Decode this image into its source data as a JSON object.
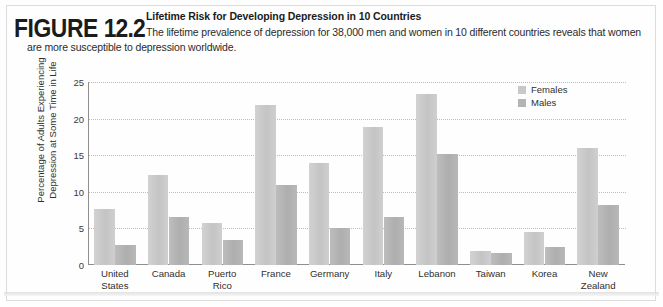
{
  "figure": {
    "label_word": "FIGURE",
    "label_number": "12.2",
    "title": "Lifetime Risk for Developing Depression in 10 Countries",
    "caption_line1": "The lifetime prevalence of depression for 38,000 men and women in 10 different countries reveals that women",
    "caption_line2": "are more susceptible to depression worldwide."
  },
  "legend": {
    "position": "top-right",
    "entries": [
      {
        "label": "Females",
        "color": "#c8c8c8"
      },
      {
        "label": "Males",
        "color": "#b4b4b4"
      }
    ]
  },
  "chart_data": {
    "type": "bar",
    "title": "Lifetime Risk for Developing Depression in 10 Countries",
    "xlabel": "",
    "ylabel": "Percentage of Adults Experiencing Depression at Some Time in Life",
    "ylim": [
      0,
      25
    ],
    "yticks": [
      0,
      5,
      10,
      15,
      20,
      25
    ],
    "ytick_labels": [
      "0",
      "5",
      "10",
      "15",
      "20",
      "25"
    ],
    "grid": true,
    "grid_axis": "y",
    "grid_style": "dotted",
    "legend_position": "top-right",
    "categories": [
      "United States",
      "Canada",
      "Puerto Rico",
      "France",
      "Germany",
      "Italy",
      "Lebanon",
      "Taiwan",
      "Korea",
      "New Zealand"
    ],
    "category_label_lines": [
      [
        "United",
        "States"
      ],
      [
        "Canada"
      ],
      [
        "Puerto",
        "Rico"
      ],
      [
        "France"
      ],
      [
        "Germany"
      ],
      [
        "Italy"
      ],
      [
        "Lebanon"
      ],
      [
        "Taiwan"
      ],
      [
        "Korea"
      ],
      [
        "New",
        "Zealand"
      ]
    ],
    "series": [
      {
        "name": "Females",
        "color": "#c8c8c8",
        "values": [
          7.7,
          12.3,
          5.8,
          21.8,
          13.9,
          18.8,
          23.4,
          1.9,
          4.5,
          16.0
        ]
      },
      {
        "name": "Males",
        "color": "#b4b4b4",
        "values": [
          2.7,
          6.5,
          3.4,
          10.9,
          5.0,
          6.6,
          15.2,
          1.6,
          2.5,
          8.2
        ]
      }
    ]
  }
}
